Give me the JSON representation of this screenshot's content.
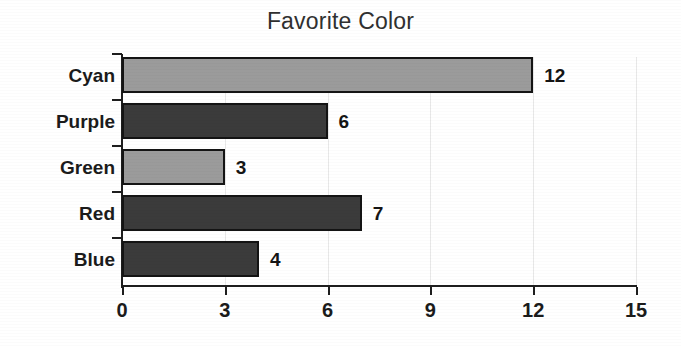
{
  "chart_data": {
    "type": "bar",
    "orientation": "horizontal",
    "title": "Favorite Color",
    "xlabel": "",
    "ylabel": "",
    "categories": [
      "Blue",
      "Red",
      "Green",
      "Purple",
      "Cyan"
    ],
    "values": [
      4,
      7,
      3,
      6,
      12
    ],
    "value_labels": [
      "4",
      "7",
      "3",
      "6",
      "12"
    ],
    "bar_shades": [
      "dark",
      "dark",
      "light",
      "dark",
      "light"
    ],
    "xlim": [
      0,
      15
    ],
    "xticks": [
      0,
      3,
      6,
      9,
      12,
      15
    ],
    "xtick_labels": [
      "0",
      "3",
      "6",
      "9",
      "12",
      "15"
    ],
    "grid": "vertical-faint",
    "legend": "none",
    "colors": {
      "bar_light": "#9b9b9b",
      "bar_dark": "#3b3b3b",
      "bar_border": "#141414",
      "axis": "#1e1e1e",
      "gridline": "#e8e8e8",
      "title_text": "#303030",
      "label_text": "#1b1b1b",
      "background": "#ffffff"
    }
  },
  "rows": [
    {
      "label": "Cyan",
      "value": 12,
      "value_label": "12",
      "shade": "light"
    },
    {
      "label": "Purple",
      "value": 6,
      "value_label": "6",
      "shade": "dark"
    },
    {
      "label": "Green",
      "value": 3,
      "value_label": "3",
      "shade": "light"
    },
    {
      "label": "Red",
      "value": 7,
      "value_label": "7",
      "shade": "dark"
    },
    {
      "label": "Blue",
      "value": 4,
      "value_label": "4",
      "shade": "dark"
    }
  ],
  "xticks": [
    {
      "label": "0",
      "value": 0
    },
    {
      "label": "3",
      "value": 3
    },
    {
      "label": "6",
      "value": 6
    },
    {
      "label": "9",
      "value": 9
    },
    {
      "label": "12",
      "value": 12
    },
    {
      "label": "15",
      "value": 15
    }
  ]
}
